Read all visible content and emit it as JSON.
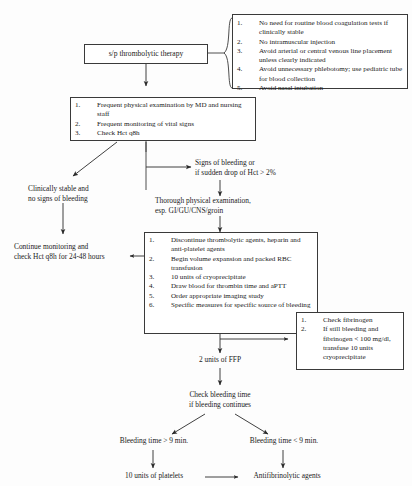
{
  "nodes": {
    "start": {
      "label": "s/p thrombolytic therapy"
    },
    "precautions": {
      "items": [
        "No need for routine blood coagulation tests if clinically stable",
        "No intramuscular injection",
        "Avoid arterial or central venous line placement unless clearly indicated",
        "Avoid unnecessary phlebotomy; use pediatric tube for blood collection",
        "Avoid nasal intubation"
      ]
    },
    "monitoring": {
      "items": [
        "Frequent physical examination by MD and nursing staff",
        "Frequent monitoring of vital signs",
        "Check Hct q8h"
      ]
    },
    "stable_branch": {
      "label_line1": "Clinically stable and",
      "label_line2": "no signs of bleeding"
    },
    "continue_monitoring": {
      "label_line1": "Continue monitoring and",
      "label_line2": "check Hct q8h for 24-48 hours"
    },
    "bleeding_branch": {
      "label_line1": "Signs of bleeding or",
      "label_line2": "if sudden drop of Hct > 2%"
    },
    "thorough_exam": {
      "label_line1": "Thorough physical examination,",
      "label_line2": "esp. GI/GU/CNS/groin"
    },
    "interventions": {
      "items": [
        "Discontinue thrombolytic agents, heparin and anti-platelet agents",
        "Begin volume expansion and packed RBC transfusion",
        "10 units of cryoprecipitate",
        "Draw blood for thrombin time and aPTT",
        "Order appropriate imaging study",
        "Specific measures for specific source of bleeding"
      ]
    },
    "fibrinogen": {
      "items": [
        "Check fibrinogen",
        "If still bleeding and fibrinogen < 100 mg/dl, transfuse 10 units cryoprecipitate"
      ]
    },
    "ffp": {
      "label": "2 units of FFP"
    },
    "bleeding_time": {
      "label_line1": "Check bleeding time",
      "label_line2": "if bleeding continues"
    },
    "bt_long": {
      "label": "Bleeding time > 9 min."
    },
    "bt_short": {
      "label": "Bleeding time < 9 min."
    },
    "platelets": {
      "label": "10 units of platelets"
    },
    "antifibrinolytic": {
      "label": "Antifibrinolytic agents"
    }
  },
  "numbering": [
    "1.",
    "2.",
    "3.",
    "4.",
    "5.",
    "6."
  ],
  "colors": {
    "line": "#3a3a3a",
    "box_border": "#3a3a3a",
    "background": "#fdfdfd",
    "text": "#1a1a1a"
  }
}
